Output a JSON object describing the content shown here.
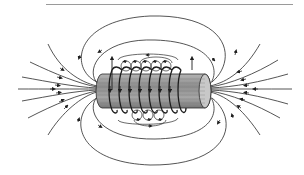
{
  "diagram": {
    "elements": {
      "header_rule": "horizontal rule",
      "core": "cylindrical core",
      "winding": "helical coil winding (8 turns)",
      "field_lines": "magnetic field lines with direction arrows",
      "local_loops": "small circular field loops around individual wires",
      "current_arrows": "vertical current direction arrows at coil ends"
    },
    "colors": {
      "line": "#2a2a2a",
      "rule": "#9a9a9a",
      "core_fill": "#9c9c9c",
      "core_dark": "#6e6e6e",
      "background": "#ffffff"
    },
    "coil_turns": 8
  }
}
